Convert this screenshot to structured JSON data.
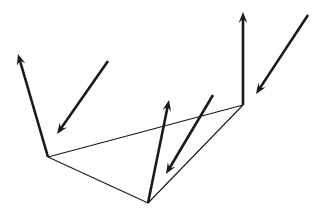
{
  "canvas": {
    "width": 322,
    "height": 215,
    "background_color": "#ffffff"
  },
  "figure": {
    "title": "Triangular surface with incident and reflected vector arrows",
    "stroke_color": "#1a1a1a",
    "edge_stroke_width": 1.1,
    "vector_stroke_width": 2.6
  },
  "chart_data": {
    "type": "diagram",
    "title": "Triangular surface with incident and reflected vector arrows",
    "xlim": [
      0,
      322
    ],
    "ylim": [
      0,
      215
    ],
    "grid": false,
    "legend": null,
    "surface": {
      "name": "triangle-surface",
      "kind": "polygon",
      "closed": true,
      "stroke": "#1a1a1a",
      "stroke_width": 1.1,
      "fill": "none",
      "vertices": [
        {
          "label": "left-vertex",
          "x": 48,
          "y": 157
        },
        {
          "label": "right-vertex",
          "x": 243,
          "y": 105
        },
        {
          "label": "bottom-vertex",
          "x": 148,
          "y": 203
        }
      ]
    },
    "vectors": [
      {
        "name": "left-outgoing-arrow",
        "direction": "up-left",
        "origin": {
          "x": 48,
          "y": 157
        },
        "tip": {
          "x": 18,
          "y": 54
        },
        "head_size": 11,
        "stroke_width": 2.6,
        "color": "#1a1a1a"
      },
      {
        "name": "left-incoming-arrow",
        "direction": "down-left",
        "origin": {
          "x": 108,
          "y": 61
        },
        "tip": {
          "x": 57,
          "y": 134
        },
        "head_size": 11,
        "stroke_width": 2.6,
        "color": "#1a1a1a"
      },
      {
        "name": "center-outgoing-arrow",
        "direction": "up",
        "origin": {
          "x": 148,
          "y": 203
        },
        "tip": {
          "x": 169,
          "y": 100
        },
        "head_size": 11,
        "stroke_width": 2.6,
        "color": "#1a1a1a"
      },
      {
        "name": "center-incoming-arrow",
        "direction": "down-left",
        "origin": {
          "x": 213,
          "y": 95
        },
        "tip": {
          "x": 166,
          "y": 174
        },
        "head_size": 11,
        "stroke_width": 2.6,
        "color": "#1a1a1a"
      },
      {
        "name": "right-outgoing-arrow",
        "direction": "up",
        "origin": {
          "x": 243,
          "y": 105
        },
        "tip": {
          "x": 243,
          "y": 12
        },
        "head_size": 11,
        "stroke_width": 2.6,
        "color": "#1a1a1a"
      },
      {
        "name": "right-incoming-arrow",
        "direction": "down-left",
        "origin": {
          "x": 308,
          "y": 15
        },
        "tip": {
          "x": 256,
          "y": 94
        },
        "head_size": 11,
        "stroke_width": 2.6,
        "color": "#1a1a1a"
      }
    ]
  }
}
